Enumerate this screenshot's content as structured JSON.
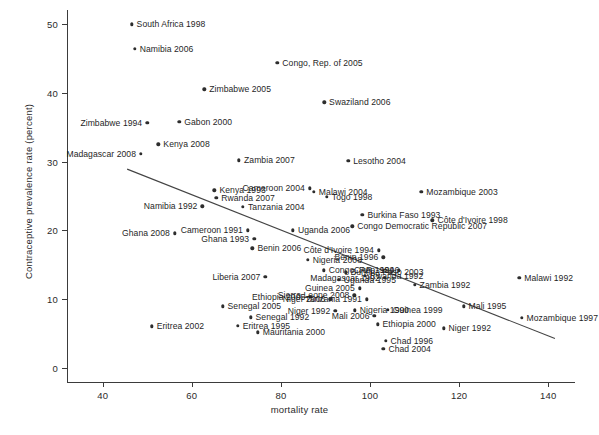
{
  "chart_data": {
    "type": "scatter",
    "title": "",
    "xlabel": "mortality rate",
    "ylabel": "Contraceptive prevalence rate (percent)",
    "xlim": [
      32,
      146
    ],
    "ylim": [
      -2,
      52
    ],
    "xticks": [
      "40",
      "60",
      "80",
      "100",
      "120",
      "140"
    ],
    "yticks": [
      "0",
      "10",
      "20",
      "30",
      "40",
      "50"
    ],
    "grid": false,
    "legend": "none",
    "trend_line": {
      "label": "fitted regression line",
      "x_start": 45.5,
      "y_start": 28.9,
      "x_end": 141.5,
      "y_end": 4.3
    },
    "points": [
      {
        "label": "South Africa 1998",
        "x": 46.5,
        "y": 49.9,
        "side": "right"
      },
      {
        "label": "Namibia 2006",
        "x": 47.2,
        "y": 46.4,
        "side": "right"
      },
      {
        "label": "Congo, Rep. of 2005",
        "x": 79.2,
        "y": 44.3,
        "side": "right"
      },
      {
        "label": "Zimbabwe 2005",
        "x": 62.8,
        "y": 40.5,
        "side": "right"
      },
      {
        "label": "Swaziland 2006",
        "x": 89.7,
        "y": 38.6,
        "side": "right"
      },
      {
        "label": "Gabon 2000",
        "x": 57.2,
        "y": 35.8,
        "side": "right"
      },
      {
        "label": "Zimbabwe 1994",
        "x": 50.0,
        "y": 35.6,
        "side": "left"
      },
      {
        "label": "Kenya 2008",
        "x": 52.5,
        "y": 32.5,
        "side": "right"
      },
      {
        "label": "Madagascar 2008",
        "x": 48.6,
        "y": 31.1,
        "side": "left"
      },
      {
        "label": "Zambia 2007",
        "x": 70.6,
        "y": 30.2,
        "side": "right"
      },
      {
        "label": "Lesotho 2004",
        "x": 95.1,
        "y": 30.1,
        "side": "right"
      },
      {
        "label": "Cameroon 2004",
        "x": 86.5,
        "y": 26.1,
        "side": "left"
      },
      {
        "label": "Kenya 1993",
        "x": 65.1,
        "y": 25.8,
        "side": "right"
      },
      {
        "label": "Malawi 2004",
        "x": 87.4,
        "y": 25.6,
        "side": "right"
      },
      {
        "label": "Mozambique 2003",
        "x": 111.5,
        "y": 25.6,
        "side": "right"
      },
      {
        "label": "Togo 1998",
        "x": 90.3,
        "y": 24.9,
        "side": "right"
      },
      {
        "label": "Rwanda 2007",
        "x": 65.5,
        "y": 24.7,
        "side": "right"
      },
      {
        "label": "Tanzania 2004",
        "x": 71.5,
        "y": 23.4,
        "side": "right"
      },
      {
        "label": "Namibia 1992",
        "x": 62.4,
        "y": 23.5,
        "side": "left"
      },
      {
        "label": "Burkina Faso 1993",
        "x": 98.3,
        "y": 22.3,
        "side": "right"
      },
      {
        "label": "Côte d'Ivoire 1998",
        "x": 114.0,
        "y": 21.5,
        "side": "right"
      },
      {
        "label": "Congo Democratic Republic 2007",
        "x": 96.0,
        "y": 20.6,
        "side": "right"
      },
      {
        "label": "Cameroon 1991",
        "x": 72.6,
        "y": 20.0,
        "side": "left"
      },
      {
        "label": "Uganda 2006",
        "x": 82.7,
        "y": 20.0,
        "side": "right"
      },
      {
        "label": "Ghana 2008",
        "x": 56.2,
        "y": 19.6,
        "side": "left"
      },
      {
        "label": "Ghana 1993",
        "x": 74.0,
        "y": 18.8,
        "side": "left"
      },
      {
        "label": "Benin 2006",
        "x": 73.6,
        "y": 17.4,
        "side": "right"
      },
      {
        "label": "Côte d'Ivoire 1994",
        "x": 102.0,
        "y": 17.1,
        "side": "left"
      },
      {
        "label": "Nigeria 2008",
        "x": 86.0,
        "y": 15.7,
        "side": "right"
      },
      {
        "label": "Benin 1996",
        "x": 103.0,
        "y": 16.1,
        "side": "left"
      },
      {
        "label": "Congo, Rep. 1996",
        "x": 89.6,
        "y": 14.2,
        "side": "right"
      },
      {
        "label": "Burkina Faso 2003",
        "x": 94.5,
        "y": 13.9,
        "side": "right"
      },
      {
        "label": "CAR 1994",
        "x": 106.5,
        "y": 14.2,
        "side": "left"
      },
      {
        "label": "Rwanda 1992",
        "x": 98.8,
        "y": 13.4,
        "side": "right"
      },
      {
        "label": "Madagascar 1992",
        "x": 103.3,
        "y": 13.1,
        "side": "left"
      },
      {
        "label": "Uganda 1995",
        "x": 93.0,
        "y": 12.8,
        "side": "right"
      },
      {
        "label": "Liberia 2007",
        "x": 76.5,
        "y": 13.3,
        "side": "left"
      },
      {
        "label": "Zambia 1992",
        "x": 110.0,
        "y": 12.1,
        "side": "right"
      },
      {
        "label": "Malawi 1992",
        "x": 133.5,
        "y": 13.1,
        "side": "right"
      },
      {
        "label": "Guinea 2005",
        "x": 97.7,
        "y": 11.6,
        "side": "left"
      },
      {
        "label": "Ethiopia 2005",
        "x": 86.6,
        "y": 10.4,
        "side": "left"
      },
      {
        "label": "Sierra Leone 2008",
        "x": 96.5,
        "y": 10.6,
        "side": "left"
      },
      {
        "label": "Tanzania 1991",
        "x": 99.3,
        "y": 10.0,
        "side": "left"
      },
      {
        "label": "Niger 2006",
        "x": 91.1,
        "y": 10.0,
        "side": "left"
      },
      {
        "label": "Senegal 2005",
        "x": 66.9,
        "y": 9.0,
        "side": "right"
      },
      {
        "label": "Guinea 1999",
        "x": 104.0,
        "y": 8.5,
        "side": "right"
      },
      {
        "label": "Nigeria 1990",
        "x": 96.6,
        "y": 8.4,
        "side": "right"
      },
      {
        "label": "Mali 1995",
        "x": 121.0,
        "y": 9.0,
        "side": "right"
      },
      {
        "label": "Niger 1992",
        "x": 92.2,
        "y": 8.3,
        "side": "left"
      },
      {
        "label": "Mali 2006",
        "x": 101.0,
        "y": 7.6,
        "side": "left"
      },
      {
        "label": "Mozambique 1997",
        "x": 134.0,
        "y": 7.3,
        "side": "right"
      },
      {
        "label": "Senegal 1992",
        "x": 73.2,
        "y": 7.4,
        "side": "right"
      },
      {
        "label": "Ethiopia 2000",
        "x": 101.7,
        "y": 6.4,
        "side": "right"
      },
      {
        "label": "Eritrea 1995",
        "x": 70.3,
        "y": 6.2,
        "side": "right"
      },
      {
        "label": "Eritrea 2002",
        "x": 51.0,
        "y": 6.1,
        "side": "right"
      },
      {
        "label": "Niger 1992 ",
        "x": 116.5,
        "y": 5.8,
        "side": "right"
      },
      {
        "label": "Mauritania 2000",
        "x": 74.8,
        "y": 5.2,
        "side": "right"
      },
      {
        "label": "Chad 1996",
        "x": 103.5,
        "y": 4.0,
        "side": "right"
      },
      {
        "label": "Chad 2004",
        "x": 103.0,
        "y": 2.8,
        "side": "right"
      }
    ]
  },
  "axes": {
    "y_title": "Contraceptive prevalence rate (percent)",
    "x_title": "mortality rate"
  }
}
